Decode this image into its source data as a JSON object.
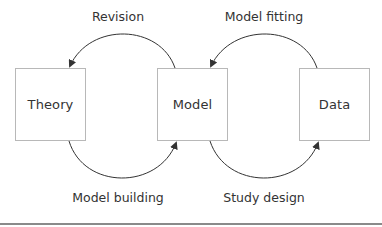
{
  "diagram": {
    "nodes": [
      {
        "id": "theory",
        "label": "Theory"
      },
      {
        "id": "model",
        "label": "Model"
      },
      {
        "id": "data",
        "label": "Data"
      }
    ],
    "edges": [
      {
        "from": "model",
        "to": "theory",
        "label": "Revision",
        "position": "top"
      },
      {
        "from": "theory",
        "to": "model",
        "label": "Model building",
        "position": "bottom"
      },
      {
        "from": "data",
        "to": "model",
        "label": "Model fitting",
        "position": "top"
      },
      {
        "from": "model",
        "to": "data",
        "label": "Study design",
        "position": "bottom"
      }
    ],
    "colors": {
      "text": "#333333",
      "box_border": "#b8b8b8",
      "arrow": "#333333",
      "rule": "#8a8a8a"
    }
  }
}
